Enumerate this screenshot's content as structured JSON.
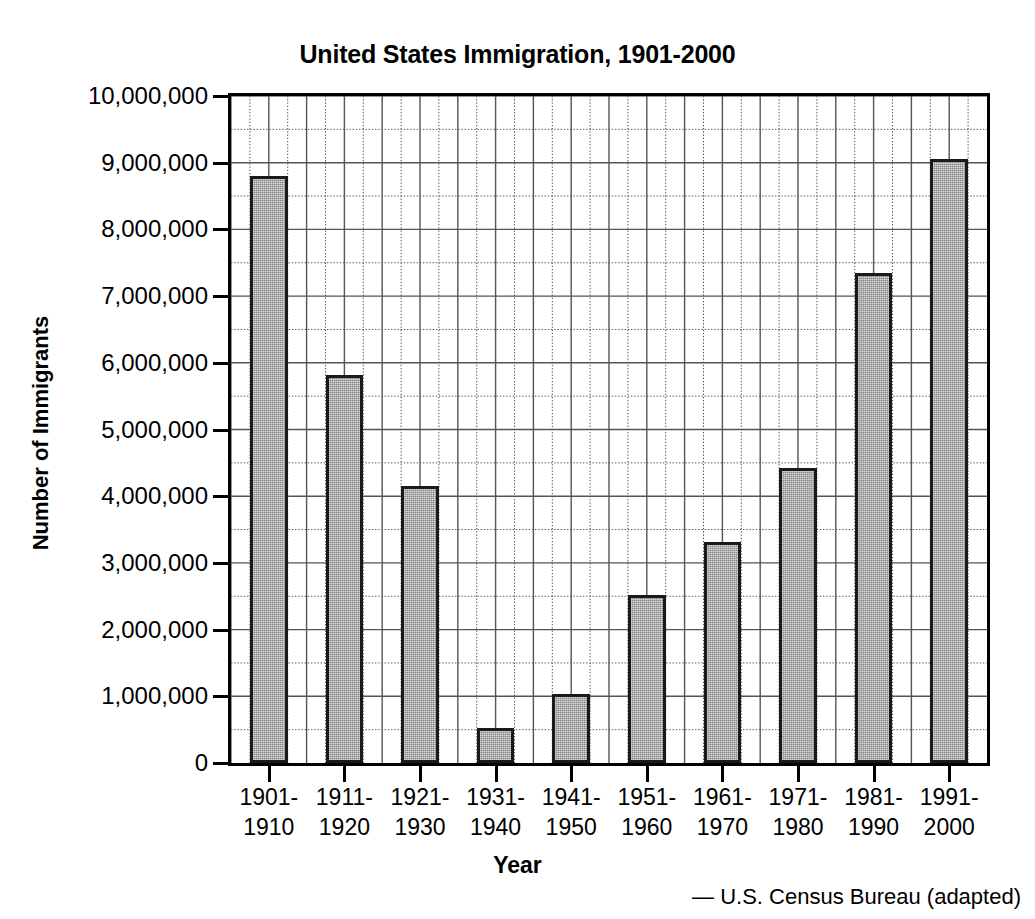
{
  "chart_data": {
    "type": "bar",
    "title": "United States Immigration, 1901-2000",
    "xlabel": "Year",
    "ylabel": "Number of Immigrants",
    "source": "— U.S. Census Bureau (adapted)",
    "categories": [
      "1901-\n1910",
      "1911-\n1920",
      "1921-\n1930",
      "1931-\n1940",
      "1941-\n1950",
      "1951-\n1960",
      "1961-\n1970",
      "1971-\n1980",
      "1981-\n1990",
      "1991-\n2000"
    ],
    "category_lines": [
      [
        "1901-",
        "1910"
      ],
      [
        "1911-",
        "1920"
      ],
      [
        "1921-",
        "1930"
      ],
      [
        "1931-",
        "1940"
      ],
      [
        "1941-",
        "1950"
      ],
      [
        "1951-",
        "1960"
      ],
      [
        "1961-",
        "1970"
      ],
      [
        "1971-",
        "1980"
      ],
      [
        "1981-",
        "1990"
      ],
      [
        "1991-",
        "2000"
      ]
    ],
    "values": [
      8800000,
      5820000,
      4150000,
      530000,
      1035000,
      2515000,
      3320000,
      4430000,
      7340000,
      9050000
    ],
    "ylim": [
      0,
      10000000
    ],
    "ytick_values": [
      0,
      1000000,
      2000000,
      3000000,
      4000000,
      5000000,
      6000000,
      7000000,
      8000000,
      9000000,
      10000000
    ],
    "ytick_labels": [
      "0",
      "1,000,000",
      "2,000,000",
      "3,000,000",
      "4,000,000",
      "5,000,000",
      "6,000,000",
      "7,000,000",
      "8,000,000",
      "9,000,000",
      "10,000,000"
    ],
    "grid": {
      "major_horizontal": true,
      "minor_horizontal_dotted": true,
      "major_vertical": true,
      "minor_vertical_dotted": true,
      "minor_y_step": 500000,
      "vertical_major_columns": 20
    },
    "legend": null,
    "bar_style": {
      "fill": "#a9a9a9",
      "edge": "#1a1a1a",
      "texture": "halftone-dither"
    },
    "colors": {
      "background": "#ffffff",
      "axis": "#000000",
      "gridline": "#555555",
      "text": "#000000"
    }
  }
}
